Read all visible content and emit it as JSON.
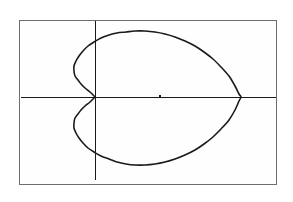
{
  "device": {
    "kind": "graphing-calculator-screen",
    "screen_label": "Graphing calculator plot window",
    "frame_color": "#6e6e70",
    "background_color": "#ffffff",
    "ink_color": "#1a1a1a"
  },
  "screen": {
    "frame": {
      "left": 19,
      "top": 20,
      "width": 258,
      "height": 165
    }
  },
  "chart_data": {
    "type": "line",
    "title": "",
    "subtitle": "",
    "xlabel": "",
    "ylabel": "",
    "curve_name": "cardioid",
    "curve_equation": "r = a(1 + cos θ)",
    "coordinate_system": "polar",
    "grid": "off",
    "legend": "none",
    "axes": {
      "x_axis": {
        "visible": true,
        "y_pixel": 97,
        "x_start": 21,
        "x_end": 276,
        "tick_marks": [
          {
            "x_pixel": 160
          }
        ]
      },
      "y_axis": {
        "visible": true,
        "x_pixel": 95,
        "y_start": 21,
        "y_end": 180,
        "tick_marks": []
      },
      "origin": {
        "x_pixel": 95,
        "y_pixel": 97
      },
      "xlim": [
        -1.2,
        2.6
      ],
      "ylim": [
        -1.2,
        1.2
      ],
      "tick_labels_x": [],
      "tick_labels_y": []
    },
    "annotations": [],
    "extrema": {
      "rightmost_point": {
        "x_pixel": 241,
        "y_pixel": 97,
        "note": "curve crosses x-axis at far right"
      },
      "topmost_point": {
        "x_pixel": 146,
        "y_pixel": 31
      },
      "bottommost_point": {
        "x_pixel": 148,
        "y_pixel": 165
      },
      "leftmost_dimple_bulge": {
        "x_pixel": 73,
        "y_pixel": 75
      },
      "cusp_point": {
        "x_pixel": 95,
        "y_pixel": 97,
        "note": "curve pinches at origin"
      }
    },
    "series": [
      {
        "name": "cardioid",
        "stroke": "#1a1a1a",
        "stroke_width": 1.6,
        "closed": true,
        "points_pixel": [
          [
            95,
            97
          ],
          [
            90,
            92
          ],
          [
            85,
            88
          ],
          [
            81,
            84
          ],
          [
            78,
            80
          ],
          [
            75,
            76
          ],
          [
            74,
            71
          ],
          [
            74,
            66
          ],
          [
            76,
            61
          ],
          [
            79,
            56
          ],
          [
            83,
            51
          ],
          [
            88,
            46
          ],
          [
            94,
            42
          ],
          [
            101,
            38
          ],
          [
            109,
            35
          ],
          [
            117,
            33
          ],
          [
            126,
            32
          ],
          [
            135,
            31
          ],
          [
            145,
            31
          ],
          [
            155,
            32
          ],
          [
            165,
            34
          ],
          [
            175,
            37
          ],
          [
            185,
            41
          ],
          [
            195,
            46
          ],
          [
            204,
            52
          ],
          [
            213,
            59
          ],
          [
            221,
            67
          ],
          [
            229,
            76
          ],
          [
            235,
            86
          ],
          [
            239,
            94
          ],
          [
            241,
            97
          ],
          [
            239,
            101
          ],
          [
            235,
            110
          ],
          [
            229,
            120
          ],
          [
            221,
            129
          ],
          [
            213,
            137
          ],
          [
            204,
            144
          ],
          [
            195,
            150
          ],
          [
            185,
            155
          ],
          [
            175,
            159
          ],
          [
            165,
            162
          ],
          [
            155,
            164
          ],
          [
            145,
            165
          ],
          [
            135,
            165
          ],
          [
            126,
            164
          ],
          [
            117,
            162
          ],
          [
            109,
            159
          ],
          [
            101,
            156
          ],
          [
            94,
            152
          ],
          [
            88,
            148
          ],
          [
            83,
            143
          ],
          [
            79,
            138
          ],
          [
            76,
            133
          ],
          [
            74,
            128
          ],
          [
            74,
            123
          ],
          [
            75,
            118
          ],
          [
            78,
            114
          ],
          [
            81,
            110
          ],
          [
            85,
            106
          ],
          [
            90,
            102
          ],
          [
            95,
            97
          ]
        ]
      }
    ]
  },
  "elements": {
    "screen_frame_name": "calculator-screen-frame",
    "plot_area_name": "plot-area",
    "x_axis_name": "x-axis",
    "y_axis_name": "y-axis",
    "curve_name": "cardioid-curve",
    "tick_name": "x-axis-tick"
  }
}
